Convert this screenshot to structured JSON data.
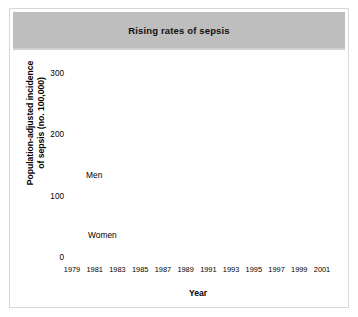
{
  "figure": {
    "title": "Rising rates of sepsis",
    "title_band_color": "#bebebe",
    "background_color": "#ffffff",
    "border_color": "#d8d8d8"
  },
  "chart_data": {
    "type": "line",
    "title": "Rising rates of sepsis",
    "xlabel": "Year",
    "ylabel": "Population-adjusted incidence of sepsis (no. 100,000)",
    "ylabel_line1": "Population-adjusted incidence",
    "ylabel_line2": "of sepsis (no. 100,000)",
    "xlim": [
      1979,
      2001
    ],
    "ylim": [
      0,
      300
    ],
    "yticks": [
      0,
      100,
      200,
      300
    ],
    "ytick_labels": [
      "0",
      "100",
      "200",
      "300"
    ],
    "xticks": [
      1979,
      1981,
      1983,
      1985,
      1987,
      1989,
      1991,
      1993,
      1995,
      1997,
      1999,
      2001
    ],
    "xtick_labels": [
      "1979",
      "1981",
      "1983",
      "1985",
      "1987",
      "1989",
      "1991",
      "1993",
      "1995",
      "1997",
      "1999",
      "2001"
    ],
    "x_minor_ticks": [
      1980,
      1982,
      1984,
      1986,
      1988,
      1990,
      1992,
      1994,
      1996,
      1998,
      2000
    ],
    "grid": false,
    "legend_position": "inline-annotation",
    "marker": "square",
    "line_style": "dotted",
    "series_color": "#1a1a1a",
    "x": [
      1979,
      1980,
      1981,
      1982,
      1983,
      1984,
      1985,
      1986,
      1987,
      1988,
      1989,
      1990,
      1991,
      1992,
      1993,
      1994,
      1995,
      1996,
      1997,
      1998,
      1999,
      2000
    ],
    "series": [
      {
        "name": "Men",
        "label": "Men",
        "values": [
          105,
          108,
          112,
          120,
          140,
          165,
          190,
          235,
          228,
          243,
          240,
          235,
          233,
          258,
          232,
          243,
          285,
          295,
          290,
          292,
          285,
          268
        ]
      },
      {
        "name": "Women",
        "label": "Women",
        "values": [
          82,
          84,
          87,
          90,
          103,
          120,
          140,
          150,
          152,
          162,
          168,
          172,
          178,
          180,
          182,
          183,
          215,
          225,
          230,
          228,
          225,
          195
        ]
      }
    ],
    "annotations": [
      {
        "text": "Men",
        "series": "Men"
      },
      {
        "text": "Women",
        "series": "Women"
      }
    ]
  }
}
